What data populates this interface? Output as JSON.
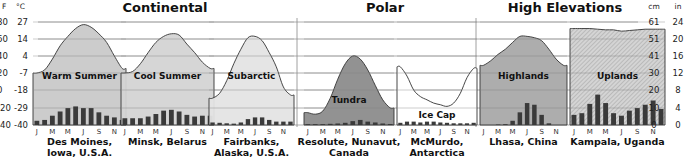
{
  "chart_data": {
    "type": "climograph",
    "title": "",
    "groups": [
      {
        "name": "Continental",
        "panels": [
          0,
          1,
          2
        ]
      },
      {
        "name": "Polar",
        "panels": [
          3,
          4
        ]
      },
      {
        "name": "High Elevations",
        "panels": [
          5,
          6
        ]
      }
    ],
    "left_axis": {
      "unit_f": "°F",
      "unit_c": "°C",
      "ticks_c": [
        "27",
        "14",
        "4",
        "-7",
        "-18",
        "-29",
        "-40"
      ],
      "ticks_f": [
        "80",
        "60",
        "40",
        "20",
        "0",
        "-20",
        "-40"
      ],
      "label": "Temperature"
    },
    "right_axis": {
      "unit_cm": "cm",
      "unit_in": "in",
      "ticks_cm": [
        "61",
        "51",
        "41",
        "30",
        "20",
        "10",
        "0"
      ],
      "ticks_in": [
        "24",
        "20",
        "16",
        "12",
        "8",
        "4",
        "0"
      ],
      "label": "Precipitation"
    },
    "month_labels": [
      "J",
      "M",
      "M",
      "J",
      "S",
      "N"
    ],
    "gridlines_c": [
      27,
      14,
      4,
      -7,
      -18,
      -29,
      -40
    ],
    "panels": [
      {
        "climate": "Warm Summer",
        "location": [
          "Des Moines,",
          "Iowa, U.S.A."
        ],
        "fill": "#c9c9c9",
        "temperature_c": [
          -7,
          -5,
          2,
          10,
          16,
          22,
          25,
          23,
          18,
          12,
          4,
          -4
        ],
        "precipitation_cm": [
          2.5,
          3,
          5.5,
          8,
          10,
          11,
          10,
          10,
          7.5,
          5.5,
          4.5,
          3
        ]
      },
      {
        "climate": "Cool Summer",
        "location": [
          "Minsk, Belarus"
        ],
        "fill": "#d4d4d4",
        "temperature_c": [
          -7,
          -6,
          -1,
          6,
          12,
          16,
          18,
          17,
          11,
          6,
          0,
          -4
        ],
        "precipitation_cm": [
          4,
          4,
          4,
          5,
          6.5,
          8.5,
          9,
          8,
          6,
          5,
          5.5,
          5.5
        ]
      },
      {
        "climate": "Subarctic",
        "location": [
          "Fairbanks,",
          "Alaska, U.S.A."
        ],
        "fill": "#e4e4e4",
        "temperature_c": [
          -23,
          -20,
          -12,
          -1,
          8,
          15,
          16,
          13,
          6,
          -3,
          -16,
          -21
        ],
        "precipitation_cm": [
          1.5,
          1.3,
          1,
          0.8,
          1.5,
          3.5,
          4.5,
          4.5,
          3,
          2,
          2,
          2
        ]
      },
      {
        "climate": "Tundra",
        "location": [
          "Resolute, Nunavut,",
          "Canada"
        ],
        "fill": "#8c8c8c",
        "temperature_c": [
          -32,
          -33,
          -31,
          -23,
          -11,
          -1,
          4,
          2,
          -5,
          -15,
          -24,
          -29
        ],
        "precipitation_cm": [
          0.5,
          0.5,
          0.5,
          0.7,
          0.9,
          1.3,
          2.3,
          3,
          2,
          1.5,
          0.9,
          0.6
        ]
      },
      {
        "climate": "Ice Cap",
        "location": [
          "McMurdo,",
          "Antarctica"
        ],
        "fill": "#ffffff",
        "temperature_c": [
          -3,
          -9,
          -18,
          -22,
          -24,
          -26,
          -27,
          -28,
          -26,
          -20,
          -10,
          -4
        ],
        "precipitation_cm": [
          1.3,
          2,
          2,
          1.5,
          2,
          2,
          1.5,
          1.3,
          1,
          1,
          1,
          1.3
        ]
      },
      {
        "climate": "Highlands",
        "location": [
          "Lhasa, China"
        ],
        "fill": "#a9a9a9",
        "temperature_c": [
          -2,
          1,
          5,
          8,
          12,
          16,
          16,
          15,
          13,
          8,
          2,
          -2
        ],
        "precipitation_cm": [
          0,
          0,
          0.3,
          0.5,
          2.5,
          7.5,
          13,
          12,
          6,
          1,
          0,
          0
        ]
      },
      {
        "climate": "Uplands",
        "location": [
          "Kampala, Uganda"
        ],
        "fill": "#d0d0d0",
        "pattern": "diagonal-hatch",
        "temperature_c": [
          22,
          22,
          22,
          21.5,
          21,
          21,
          20,
          20.5,
          21,
          21.5,
          21.5,
          21.5
        ],
        "precipitation_cm": [
          6,
          7,
          12.5,
          18,
          13,
          7,
          5.5,
          8.5,
          10,
          12,
          14.5,
          9.5
        ]
      }
    ],
    "grid": true,
    "legend": "none"
  }
}
